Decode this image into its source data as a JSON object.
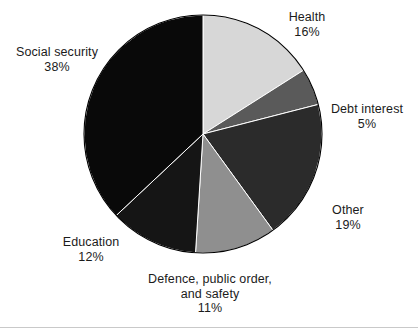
{
  "chart_data": {
    "type": "pie",
    "title": "",
    "subtitle": "",
    "xlabel": "",
    "ylabel": "",
    "legend_position": "none",
    "grid": false,
    "unit": "%",
    "start_angle_deg": 0,
    "direction": "clockwise",
    "categories": [
      "Health",
      "Debt interest",
      "Other",
      "Defence, public order, and safety",
      "Education",
      "Social security"
    ],
    "values": [
      16,
      5,
      19,
      11,
      12,
      38
    ],
    "colors": [
      "#d7d7d7",
      "#5a5a5a",
      "#2b2b2b",
      "#8f8f8f",
      "#151515",
      "#090909"
    ],
    "slices": [
      {
        "name": "Health",
        "value": 16,
        "value_label": "16%",
        "color": "#d7d7d7",
        "start_deg": 0,
        "end_deg": 57.6
      },
      {
        "name": "Debt interest",
        "value": 5,
        "value_label": "5%",
        "color": "#5a5a5a",
        "start_deg": 57.6,
        "end_deg": 75.6
      },
      {
        "name": "Other",
        "value": 19,
        "value_label": "19%",
        "color": "#2b2b2b",
        "start_deg": 75.6,
        "end_deg": 144.0
      },
      {
        "name": "Defence, public order, and safety",
        "name_line1": "Defence, public order,",
        "name_line2": "and safety",
        "value": 11,
        "value_label": "11%",
        "color": "#8f8f8f",
        "start_deg": 144.0,
        "end_deg": 183.6
      },
      {
        "name": "Education",
        "value": 12,
        "value_label": "12%",
        "color": "#151515",
        "start_deg": 183.6,
        "end_deg": 226.8
      },
      {
        "name": "Social security",
        "value": 38,
        "value_label": "38%",
        "color": "#090909",
        "start_deg": 226.8,
        "end_deg": 360.0
      }
    ]
  },
  "labels": {
    "health": {
      "name": "Health",
      "value": "16%"
    },
    "debt_interest": {
      "name": "Debt interest",
      "value": "5%"
    },
    "other": {
      "name": "Other",
      "value": "19%"
    },
    "defence": {
      "name_line1": "Defence, public order,",
      "name_line2": "and safety",
      "value": "11%"
    },
    "education": {
      "name": "Education",
      "value": "12%"
    },
    "social_security": {
      "name": "Social security",
      "value": "38%"
    }
  },
  "geometry": {
    "center_x": 203,
    "center_y": 134,
    "radius": 119,
    "outline_color": "#000000"
  }
}
